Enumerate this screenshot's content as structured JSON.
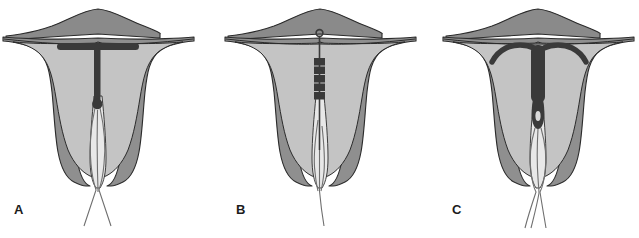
{
  "figure": {
    "background_color": "#ffffff",
    "width": 604,
    "height": 238
  },
  "palette": {
    "myometrium": "#8f8f8f",
    "fundus_dome": "#8a8a8a",
    "endometrial_cavity": "#c4c4c4",
    "cervical_canal": "#e8e8e8",
    "outline": "#2b2b2b",
    "device": "#3a3a3a",
    "string": "#6f6f6f",
    "label_color": "#1c1c1c",
    "background": "#ffffff"
  },
  "panels": [
    {
      "id": "panel-a",
      "label": "A",
      "label_x": 14,
      "label_y": 210,
      "offset_x": 0,
      "device": {
        "name": "t-shaped-iud-correct-position",
        "type": "t-frame",
        "description": "T-shaped IUD correctly positioned at uterine fundus with horizontal crossbar and vertical stem ending in a bulb",
        "arm_style": "straight-horizontal-bar",
        "position": "fundal",
        "strings": 2
      }
    },
    {
      "id": "panel-b",
      "label": "B",
      "label_x": 222,
      "label_y": 210,
      "offset_x": 222,
      "device": {
        "name": "rod-capsule-iud",
        "type": "rod-capsule",
        "description": "Linear rod/capsule device with small ring knob at fundus and segmented rectangular body on a thin shaft",
        "arm_style": "none",
        "position": "fundal",
        "segments": 5,
        "strings": 1
      }
    },
    {
      "id": "panel-c",
      "label": "C",
      "label_x": 452,
      "label_y": 210,
      "offset_x": 440,
      "device": {
        "name": "t-shaped-iud-displaced",
        "type": "t-frame-curved-arms",
        "description": "T-shaped IUD with downward-curving arms displaced low toward the internal cervical os",
        "arm_style": "curved-drooping-arms",
        "position": "low-displaced",
        "strings": 3
      }
    }
  ]
}
